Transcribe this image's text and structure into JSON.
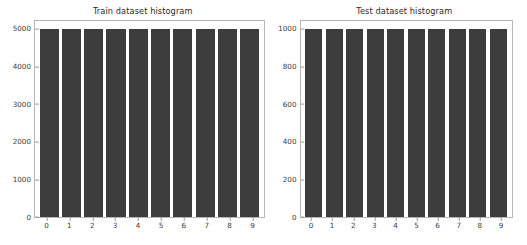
{
  "figure": {
    "background_color": "#ffffff",
    "bar_color": "#3d3d3d",
    "axes_color": "#b6b6b6",
    "tick_color": "#3c3c3c"
  },
  "chart_data": [
    {
      "type": "bar",
      "title": "Train dataset histogram",
      "xlabel": "",
      "ylabel": "",
      "categories": [
        "0",
        "1",
        "2",
        "3",
        "4",
        "5",
        "6",
        "7",
        "8",
        "9"
      ],
      "values": [
        5000,
        5000,
        5000,
        5000,
        5000,
        5000,
        5000,
        5000,
        5000,
        5000
      ],
      "ylim": [
        0,
        5200
      ],
      "yticks": [
        0,
        1000,
        2000,
        3000,
        4000,
        5000
      ],
      "ytick_labels": [
        "0",
        "1000",
        "2000",
        "3000",
        "4000",
        "5000"
      ],
      "xtick_labels": [
        "0",
        "1",
        "2",
        "3",
        "4",
        "5",
        "6",
        "7",
        "8",
        "9"
      ],
      "grid": false,
      "legend": null
    },
    {
      "type": "bar",
      "title": "Test dataset histogram",
      "xlabel": "",
      "ylabel": "",
      "categories": [
        "0",
        "1",
        "2",
        "3",
        "4",
        "5",
        "6",
        "7",
        "8",
        "9"
      ],
      "values": [
        1000,
        1000,
        1000,
        1000,
        1000,
        1000,
        1000,
        1000,
        1000,
        1000
      ],
      "ylim": [
        0,
        1040
      ],
      "yticks": [
        0,
        200,
        400,
        600,
        800,
        1000
      ],
      "ytick_labels": [
        "0",
        "200",
        "400",
        "600",
        "800",
        "1000"
      ],
      "xtick_labels": [
        "0",
        "1",
        "2",
        "3",
        "4",
        "5",
        "6",
        "7",
        "8",
        "9"
      ],
      "grid": false,
      "legend": null
    }
  ]
}
